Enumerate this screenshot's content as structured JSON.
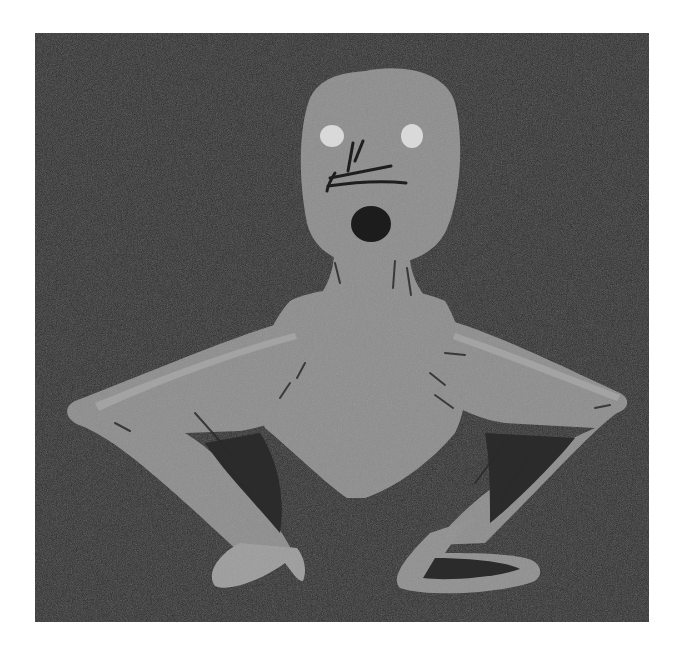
{
  "image": {
    "description": "Sketchy gray humanoid figure on dark noisy background",
    "colors": {
      "background": "#2b2b2b",
      "page": "#ffffff",
      "figure": "#8c8c8c",
      "figure_highlight": "#a8a8a8",
      "eyes": "#d9d9d9",
      "stroke": "#1e1e1e"
    },
    "parts": [
      "head",
      "eyes",
      "nose-scribble",
      "mouth",
      "neck",
      "shoulders",
      "torso",
      "left-arm",
      "right-arm",
      "left-hand",
      "right-hand"
    ]
  }
}
